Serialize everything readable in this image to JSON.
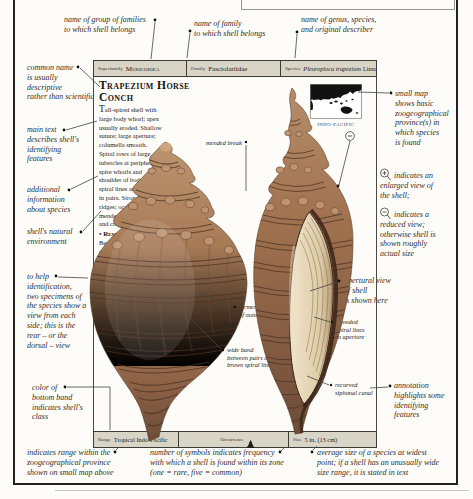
{
  "colors": {
    "bar_background": "#d8d4c6",
    "page_background": "#fdfcf8",
    "frame": "#222222",
    "annotation_text": "#2e2e2e",
    "shell_brown": "#9c7155",
    "shell_band_brown": "#4a3223",
    "aperture_cream": "#e8dcc2",
    "map_land": "#121212"
  },
  "header": {
    "superfamily_label": "Superfamily",
    "superfamily_value": "Muricoidea",
    "family_label": "Family",
    "family_value": "Fasciolariidae",
    "species_label": "Species",
    "species_name": "Pleuroploca trapezium",
    "species_author": "Linnaeus"
  },
  "entry": {
    "common_name": "Trapezium Horse Conch",
    "description": "Tall-spired shell with large body whorl; apex usually eroded. Shallow suture; large aperture; columella smooth. Spiral rows of large tubercles at periphery of spire whorls and shoulder of body whorl; spiral lines are arranged in pairs. Strong growth ridges; occasional mended breaks. Reddish and cream.",
    "remark_label": "• Remark",
    "remark_text": "Best-known member of group.",
    "habitat_label": "• Habitat",
    "habitat_text": "Shallow water near coral.",
    "map_region": "INDO-PACIFIC",
    "shell_labels": {
      "mended_break": "mended break",
      "former_edge": "former edge\nof outer lip",
      "wide_band": "wide band\nbetween pairs of\nbrown spiral lines",
      "crowded": "crowded\nspiral lines\nin aperture",
      "recurved": "recurved\nsiphonal canal"
    }
  },
  "footer": {
    "range_label": "Range",
    "range_value": "Tropical Indo-Pacific",
    "occurrence_label": "Occurrence",
    "occurrence_count": 4,
    "size_label": "Size",
    "size_value": "5 in. (13 cm)"
  },
  "annotations": {
    "group_families": "name of group of families\nto which shell belongs",
    "family": "name of family\nto which shell belongs",
    "genus": "name of genus, species,\nand original describer",
    "common_name": "common name\nis usually\ndescriptive\nrather than scientific",
    "main_text": "main text\ndescribes shell's\nidentifying\nfeatures",
    "additional": "additional\ninformation\nabout species",
    "environment": "shell's natural\nenvironment",
    "two_specimens": "to help\nidentification,\ntwo specimens of\nthe species show a\nview from each\nside; this is the\nrear – or the\ndorsal – view",
    "bottom_band": "color of\nbottom band\nindicates shell's\nclass",
    "range_note": "indicates range within the\nzoogeographical province\nshown on small map above",
    "small_map": "small map\nshows basic\nzoogeographical\nprovince(s) in\nwhich species\nis found",
    "enlarged_view": "indicates an\nenlarged view of\nthe shell;",
    "reduced_view": "indicates a\nreduced view;\notherwise shell is\nshown roughly\nactual size",
    "apertural_view": "apertural view\nof shell\nis shown here",
    "annotation_note": "annotation\nhighlights some\nidentifying\nfeatures",
    "occurrence_note": "number of symbols indicates frequency\nwith which a shell is found within its zone\n(one = rare, five = common)",
    "size_note": "average size of a species at widest\npoint; if a shell has an unusually wide\nsize range, it is stated in text"
  }
}
